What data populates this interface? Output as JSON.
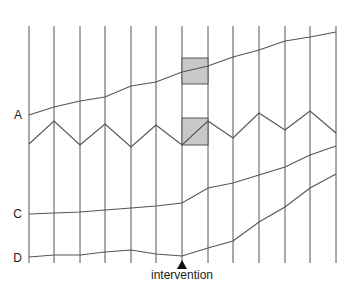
{
  "diagram": {
    "type": "time-series-schematic",
    "vertical_lines_x": [
      29,
      54,
      80,
      105,
      131,
      156,
      182,
      208,
      233,
      259,
      285,
      310,
      336
    ],
    "vertical_top": 26,
    "vertical_bottom": 263,
    "line_color": "#555555",
    "box_fill": "#c8c8c8",
    "box_stroke": "#555555",
    "series": [
      {
        "label": "A",
        "label_pos": [
          22,
          119
        ],
        "points": [
          [
            29,
            115
          ],
          [
            54,
            107
          ],
          [
            80,
            101
          ],
          [
            105,
            97
          ],
          [
            131,
            86
          ],
          [
            156,
            82
          ],
          [
            182,
            72
          ],
          [
            208,
            66
          ],
          [
            233,
            57
          ],
          [
            259,
            50
          ],
          [
            285,
            41
          ],
          [
            310,
            37
          ],
          [
            336,
            32
          ]
        ]
      },
      {
        "label": "",
        "label_pos": null,
        "points": [
          [
            29,
            144
          ],
          [
            54,
            121
          ],
          [
            80,
            145
          ],
          [
            105,
            124
          ],
          [
            131,
            147
          ],
          [
            156,
            125
          ],
          [
            182,
            145
          ],
          [
            208,
            121
          ],
          [
            233,
            138
          ],
          [
            259,
            113
          ],
          [
            285,
            130
          ],
          [
            310,
            111
          ],
          [
            336,
            133
          ]
        ]
      },
      {
        "label": "C",
        "label_pos": [
          22,
          218
        ],
        "points": [
          [
            29,
            214
          ],
          [
            54,
            213
          ],
          [
            80,
            212
          ],
          [
            105,
            210
          ],
          [
            131,
            208
          ],
          [
            156,
            206
          ],
          [
            182,
            203
          ],
          [
            208,
            188
          ],
          [
            233,
            183
          ],
          [
            259,
            175
          ],
          [
            285,
            167
          ],
          [
            310,
            155
          ],
          [
            336,
            146
          ]
        ]
      },
      {
        "label": "D",
        "label_pos": [
          22,
          262
        ],
        "points": [
          [
            29,
            257
          ],
          [
            54,
            255
          ],
          [
            80,
            255
          ],
          [
            105,
            252
          ],
          [
            131,
            250
          ],
          [
            156,
            254
          ],
          [
            182,
            256
          ],
          [
            208,
            248
          ],
          [
            233,
            241
          ],
          [
            259,
            222
          ],
          [
            285,
            207
          ],
          [
            310,
            188
          ],
          [
            336,
            174
          ]
        ]
      }
    ],
    "highlight_boxes": [
      {
        "x": 182,
        "y": 58,
        "width": 26,
        "height": 26
      },
      {
        "x": 182,
        "y": 118,
        "width": 26,
        "height": 27,
        "diagonal": true
      }
    ],
    "intervention": {
      "label": "intervention",
      "x": 182,
      "marker": "triangle-up",
      "marker_tip_y": 260,
      "marker_base_y": 269,
      "text_y": 279
    }
  }
}
